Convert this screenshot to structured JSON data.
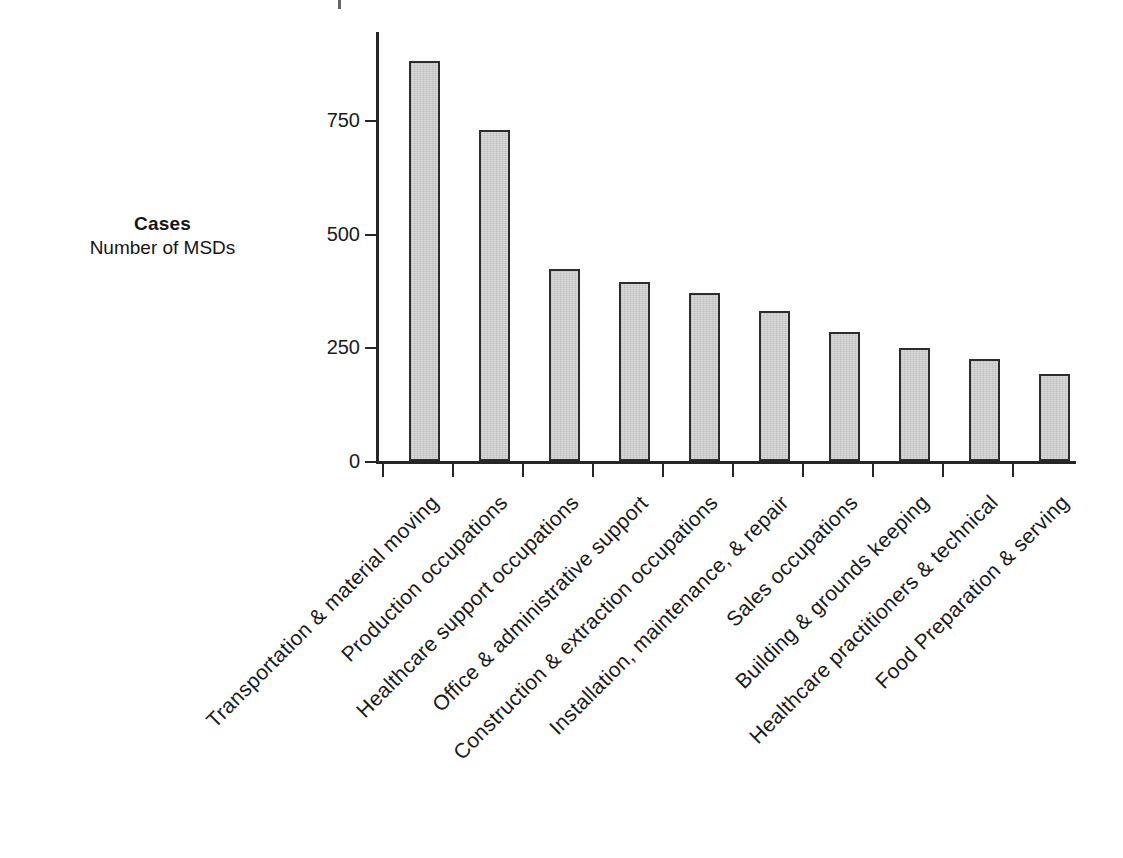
{
  "chart_data": {
    "type": "bar",
    "title": "",
    "subtitle": "",
    "xlabel": "",
    "ylabel": "Cases",
    "ylabel_sub": "Number of MSDs",
    "ylim": [
      0,
      900
    ],
    "yticks": [
      0,
      250,
      500,
      750
    ],
    "ytick_labels": [
      "0",
      "250",
      "500",
      "750"
    ],
    "grid": false,
    "legend": false,
    "legend_position": "none",
    "orientation": "vertical",
    "bar_color": "#cdcdcd",
    "bar_edge_color": "#2c2c2c",
    "axis_color": "#262626",
    "label_rotation": -45,
    "categories": [
      "Transportation & material moving",
      "Production occupations",
      "Healthcare support occupations",
      "Office & administrative support",
      "Construction & extraction occupations",
      "Installation, maintenance, & repair",
      "Sales occupations",
      "Building & grounds keeping",
      "Healthcare practitioners & technical",
      "Food Preparation & serving"
    ],
    "values": [
      881,
      728,
      422,
      393,
      370,
      330,
      284,
      249,
      224,
      192
    ]
  },
  "axis_titles": {
    "main": "Cases",
    "sub": "Number of MSDs"
  }
}
